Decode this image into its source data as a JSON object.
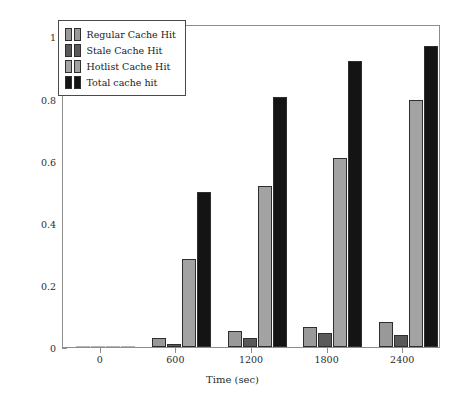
{
  "chart_data": {
    "type": "bar",
    "title": "",
    "xlabel": "Time (sec)",
    "ylabel": "Cache response (%)",
    "xlim": [
      -300,
      2700
    ],
    "ylim": [
      0,
      1.04
    ],
    "grid": false,
    "legend_position": "upper-left",
    "categories": [
      0,
      600,
      1200,
      1800,
      2400
    ],
    "xtick_labels": [
      "0",
      "600",
      "1200",
      "1800",
      "2400"
    ],
    "ytick_labels": [
      "0",
      "0.2",
      "0.4",
      "0.6",
      "0.8",
      "1"
    ],
    "ytick_values": [
      0,
      0.2,
      0.4,
      0.6,
      0.8,
      1
    ],
    "series": [
      {
        "name": "Regular Cache Hit",
        "color": "#999999",
        "values": [
          0.0,
          0.03,
          0.05,
          0.065,
          0.08
        ]
      },
      {
        "name": "Stale Cache Hit",
        "color": "#5a5a5a",
        "values": [
          0.0,
          0.01,
          0.028,
          0.045,
          0.04
        ]
      },
      {
        "name": "Hotlist Cache Hit",
        "color": "#a3a3a3",
        "values": [
          0.0,
          0.285,
          0.52,
          0.61,
          0.795
        ]
      },
      {
        "name": "Total cache hit",
        "color": "#141414",
        "values": [
          0.0,
          0.5,
          0.805,
          0.92,
          0.97
        ]
      }
    ]
  },
  "legend": {
    "items": [
      {
        "label": "Regular Cache Hit"
      },
      {
        "label": "Stale Cache Hit"
      },
      {
        "label": "Hotlist Cache Hit"
      },
      {
        "label": "Total cache hit"
      }
    ]
  }
}
